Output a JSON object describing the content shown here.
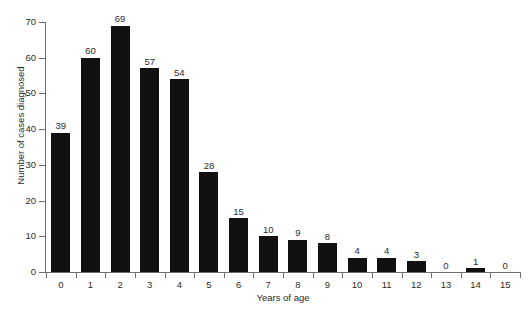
{
  "chart_data": {
    "type": "bar",
    "title": "",
    "subtitle": "",
    "xlabel": "Years of age",
    "ylabel": "Number of cases diagnosed",
    "categories": [
      "0",
      "1",
      "2",
      "3",
      "4",
      "5",
      "6",
      "7",
      "8",
      "9",
      "10",
      "11",
      "12",
      "13",
      "14",
      "15"
    ],
    "values": [
      39,
      60,
      69,
      57,
      54,
      28,
      15,
      10,
      9,
      8,
      4,
      4,
      3,
      0,
      1,
      0
    ],
    "value_labels": [
      "39",
      "60",
      "69",
      "57",
      "54",
      "28",
      "15",
      "10",
      "9",
      "8",
      "4",
      "4",
      "3",
      "0",
      "1",
      "0"
    ],
    "ylim": [
      0,
      70
    ],
    "yticks": [
      0,
      10,
      20,
      30,
      40,
      50,
      60,
      70
    ],
    "ytick_labels": [
      "0",
      "10",
      "20",
      "30",
      "40",
      "50",
      "60",
      "70"
    ],
    "grid": false,
    "legend": null,
    "legend_position": "none",
    "bar_color": "#111111",
    "axis_color": "#6f6f6f",
    "text_color": "#2b2b2b",
    "background_color": "#ffffff",
    "show_value_labels": true,
    "annotations": []
  }
}
